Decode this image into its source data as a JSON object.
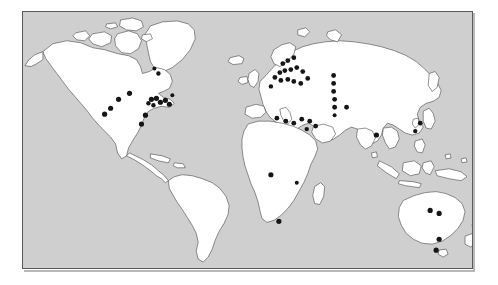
{
  "figure": {
    "background_color": "#ffffff"
  },
  "map": {
    "panel_background": "#cfcfcf",
    "ocean_color": "#cfcfcf",
    "land_color": "#ffffff",
    "coastline_color": "#3a3a3a",
    "border_color": "#5a5a5a",
    "marker_color": "#151515",
    "projection": "equirectangular",
    "lon_range": [
      -180,
      180
    ],
    "lat_range": [
      -60,
      84
    ]
  },
  "chart_data": {
    "type": "scatter",
    "xlabel": "",
    "ylabel": "",
    "legend": [],
    "marker_shape": "circle",
    "marker_color": "#151515",
    "total_points": 55,
    "regions": [
      {
        "name": "North America",
        "count": 16
      },
      {
        "name": "Europe",
        "count": 22
      },
      {
        "name": "Asia",
        "count": 10
      },
      {
        "name": "Africa",
        "count": 3
      },
      {
        "name": "Australia",
        "count": 4
      },
      {
        "name": "South America",
        "count": 0
      }
    ],
    "points": [
      {
        "region": "North America",
        "px": 88,
        "py": 97,
        "r": 2.6
      },
      {
        "region": "North America",
        "px": 96,
        "py": 88,
        "r": 2.6
      },
      {
        "region": "North America",
        "px": 107,
        "py": 82,
        "r": 2.6
      },
      {
        "region": "North America",
        "px": 82,
        "py": 103,
        "r": 2.6
      },
      {
        "region": "North America",
        "px": 119,
        "py": 113,
        "r": 2.6
      },
      {
        "region": "North America",
        "px": 123,
        "py": 104,
        "r": 2.6
      },
      {
        "region": "North America",
        "px": 129,
        "py": 88,
        "r": 2.6
      },
      {
        "region": "North America",
        "px": 134,
        "py": 87,
        "r": 2.6
      },
      {
        "region": "North America",
        "px": 138,
        "py": 91,
        "r": 2.6
      },
      {
        "region": "North America",
        "px": 143,
        "py": 89,
        "r": 2.6
      },
      {
        "region": "North America",
        "px": 147,
        "py": 93,
        "r": 2.6
      },
      {
        "region": "North America",
        "px": 131,
        "py": 94,
        "r": 2.2
      },
      {
        "region": "North America",
        "px": 126,
        "py": 92,
        "r": 2.2
      },
      {
        "region": "North America",
        "px": 136,
        "py": 62,
        "r": 2.2
      },
      {
        "region": "North America",
        "px": 132,
        "py": 57,
        "r": 2.0
      },
      {
        "region": "North America",
        "px": 150,
        "py": 84,
        "r": 2.0
      },
      {
        "region": "Europe",
        "px": 261,
        "py": 52,
        "r": 2.4
      },
      {
        "region": "Europe",
        "px": 266,
        "py": 49,
        "r": 2.4
      },
      {
        "region": "Europe",
        "px": 272,
        "py": 46,
        "r": 2.4
      },
      {
        "region": "Europe",
        "px": 258,
        "py": 61,
        "r": 2.4
      },
      {
        "region": "Europe",
        "px": 263,
        "py": 59,
        "r": 2.4
      },
      {
        "region": "Europe",
        "px": 269,
        "py": 58,
        "r": 2.4
      },
      {
        "region": "Europe",
        "px": 275,
        "py": 56,
        "r": 2.4
      },
      {
        "region": "Europe",
        "px": 281,
        "py": 60,
        "r": 2.4
      },
      {
        "region": "Europe",
        "px": 253,
        "py": 66,
        "r": 2.4
      },
      {
        "region": "Europe",
        "px": 259,
        "py": 69,
        "r": 2.4
      },
      {
        "region": "Europe",
        "px": 266,
        "py": 68,
        "r": 2.4
      },
      {
        "region": "Europe",
        "px": 272,
        "py": 70,
        "r": 2.4
      },
      {
        "region": "Europe",
        "px": 279,
        "py": 72,
        "r": 2.4
      },
      {
        "region": "Europe",
        "px": 286,
        "py": 67,
        "r": 2.4
      },
      {
        "region": "Europe",
        "px": 249,
        "py": 75,
        "r": 2.2
      },
      {
        "region": "Europe",
        "px": 255,
        "py": 107,
        "r": 2.4
      },
      {
        "region": "Europe",
        "px": 264,
        "py": 110,
        "r": 2.4
      },
      {
        "region": "Europe",
        "px": 272,
        "py": 112,
        "r": 2.4
      },
      {
        "region": "Europe",
        "px": 280,
        "py": 108,
        "r": 2.4
      },
      {
        "region": "Europe",
        "px": 288,
        "py": 110,
        "r": 2.4
      },
      {
        "region": "Europe",
        "px": 294,
        "py": 115,
        "r": 2.4
      },
      {
        "region": "Europe",
        "px": 285,
        "py": 118,
        "r": 2.2
      },
      {
        "region": "Asia",
        "px": 312,
        "py": 64,
        "r": 2.4
      },
      {
        "region": "Asia",
        "px": 312,
        "py": 72,
        "r": 2.4
      },
      {
        "region": "Asia",
        "px": 312,
        "py": 80,
        "r": 2.4
      },
      {
        "region": "Asia",
        "px": 313,
        "py": 88,
        "r": 2.4
      },
      {
        "region": "Asia",
        "px": 313,
        "py": 96,
        "r": 2.4
      },
      {
        "region": "Asia",
        "px": 325,
        "py": 96,
        "r": 2.4
      },
      {
        "region": "Asia",
        "px": 313,
        "py": 104,
        "r": 2.0
      },
      {
        "region": "Asia",
        "px": 355,
        "py": 124,
        "r": 2.6
      },
      {
        "region": "Asia",
        "px": 399,
        "py": 112,
        "r": 2.4
      },
      {
        "region": "Asia",
        "px": 394,
        "py": 120,
        "r": 2.2
      },
      {
        "region": "Africa",
        "px": 249,
        "py": 164,
        "r": 2.6
      },
      {
        "region": "Africa",
        "px": 275,
        "py": 172,
        "r": 2.0
      },
      {
        "region": "Africa",
        "px": 257,
        "py": 211,
        "r": 2.6
      },
      {
        "region": "Australia",
        "px": 409,
        "py": 200,
        "r": 2.6
      },
      {
        "region": "Australia",
        "px": 418,
        "py": 203,
        "r": 2.6
      },
      {
        "region": "Australia",
        "px": 418,
        "py": 229,
        "r": 2.6
      },
      {
        "region": "Australia",
        "px": 415,
        "py": 240,
        "r": 2.6
      }
    ]
  }
}
